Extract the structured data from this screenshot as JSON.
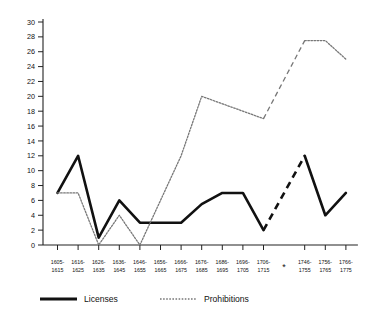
{
  "chart_data": {
    "type": "line",
    "title": "",
    "subtitle": "",
    "xlabel": "",
    "ylabel": "",
    "ylim": [
      0,
      30
    ],
    "ytick_step": 2,
    "grid": false,
    "legend_position": "bottom",
    "axis_break_marker": "*",
    "axis_break_after_category": "1706-1715",
    "categories": [
      "1605-1615",
      "1616-1625",
      "1626-1635",
      "1636-1645",
      "1646-1655",
      "1656-1665",
      "1666-1675",
      "1676-1685",
      "1686-1695",
      "1696-1705",
      "1706-1715",
      "1746-1755",
      "1756-1765",
      "1766-1775"
    ],
    "categories_top": [
      "1605-",
      "1616-",
      "1626-",
      "1636-",
      "1646-",
      "1656-",
      "1666-",
      "1676-",
      "1686-",
      "1696-",
      "1706-",
      "1746-",
      "1756-",
      "1766-"
    ],
    "categories_bottom": [
      "1615",
      "1625",
      "1635",
      "1645",
      "1655",
      "1665",
      "1675",
      "1685",
      "1695",
      "1705",
      "1715",
      "1755",
      "1765",
      "1775"
    ],
    "ytick_labels": [
      "0",
      "2",
      "4",
      "6",
      "8",
      "10",
      "12",
      "14",
      "16",
      "18",
      "20",
      "22",
      "24",
      "26",
      "28",
      "30"
    ],
    "ytick_values": [
      0,
      2,
      4,
      6,
      8,
      10,
      12,
      14,
      16,
      18,
      20,
      22,
      24,
      26,
      28,
      30
    ],
    "series": [
      {
        "name": "Licenses",
        "style": "solid",
        "color": "#111111",
        "width": 2.6,
        "values": [
          7,
          12,
          1,
          6,
          3,
          3,
          3,
          5.5,
          7,
          7,
          2,
          12,
          4,
          7
        ],
        "bridge_dashed_between": [
          10,
          11
        ]
      },
      {
        "name": "Prohibitions",
        "style": "dotted",
        "color": "#777777",
        "width": 1.3,
        "values": [
          7,
          7,
          0,
          4,
          0,
          6,
          12,
          20,
          19,
          18,
          17,
          27.5,
          27.5,
          25
        ],
        "bridge_dashed_between": [
          10,
          11
        ]
      }
    ],
    "legend": [
      {
        "label": "Licenses",
        "style": "solid"
      },
      {
        "label": "Prohibitions",
        "style": "dotted"
      }
    ]
  }
}
